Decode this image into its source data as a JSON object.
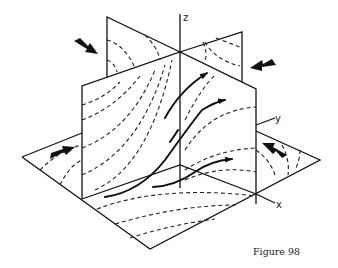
{
  "figure": {
    "caption": "Figure 98",
    "axes": {
      "x_label": "x",
      "y_label": "y",
      "z_label": "z"
    },
    "colors": {
      "line": "#111111",
      "background": "#ffffff"
    }
  }
}
